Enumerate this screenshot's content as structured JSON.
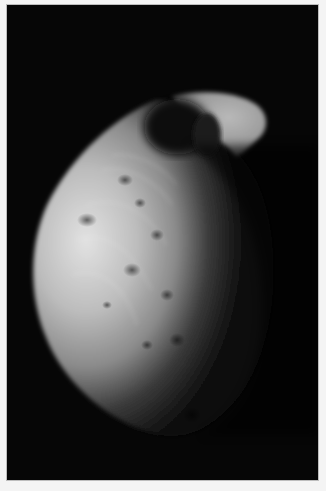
{
  "image": {
    "subject": "Phobos",
    "alt": "Grayscale photograph of Phobos, the irregular cratered moon of Mars, lit from the left against a black sky",
    "frame_color": "#060606",
    "border_color": "#f4f4f4"
  }
}
